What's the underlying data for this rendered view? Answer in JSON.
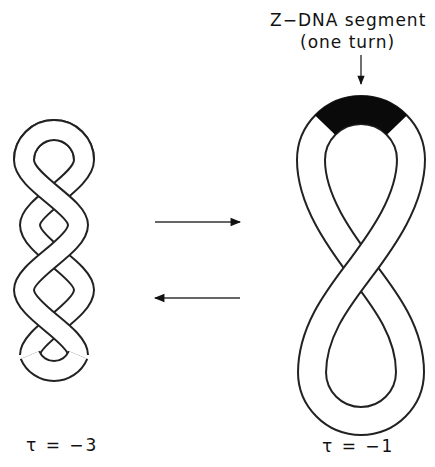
{
  "figure": {
    "annotation": {
      "line1": "Z−DNA segment",
      "line2": "(one turn)"
    },
    "left": {
      "name": "interwound supercoil",
      "label": "τ = −3",
      "lobes": 4
    },
    "right": {
      "name": "figure-eight with Z-DNA segment",
      "label": "τ = −1"
    },
    "arrows": [
      {
        "direction": "right"
      },
      {
        "direction": "left"
      }
    ],
    "colors": {
      "ink": "#111111",
      "band": "#ffffff",
      "zdna": "#0a0a0a"
    }
  }
}
